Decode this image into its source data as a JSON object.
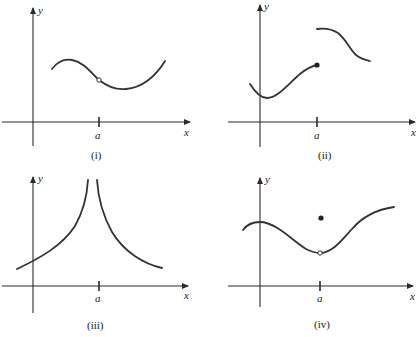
{
  "panels": [
    {
      "caption": "(i)",
      "x_label": "x",
      "y_label": "y",
      "tick_label": "a",
      "description": "Continuous curve with a hole (open circle) at x = a; f(a) undefined"
    },
    {
      "caption": "(ii)",
      "x_label": "x",
      "y_label": "y",
      "tick_label": "a",
      "description": "Jump discontinuity at x = a; filled dot on left branch end, right branch starts higher"
    },
    {
      "caption": "(iii)",
      "x_label": "x",
      "y_label": "y",
      "tick_label": "a",
      "description": "Infinite discontinuity: both branches rise to vertical asymptote at x = a"
    },
    {
      "caption": "(iv)",
      "x_label": "x",
      "y_label": "y",
      "tick_label": "a",
      "description": "Removable discontinuity: open circle on curve at x = a, filled dot above it"
    }
  ],
  "colors": {
    "ink": "#333333",
    "background": "#ffffff"
  }
}
